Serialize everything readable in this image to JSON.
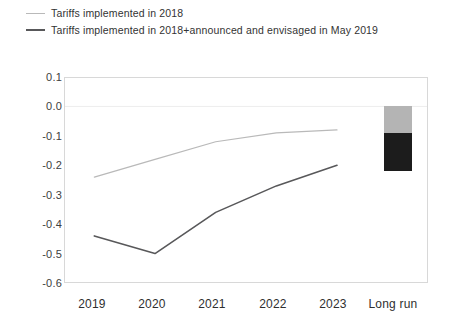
{
  "chart_data": {
    "type": "line",
    "title": "",
    "xlabel": "",
    "ylabel": "",
    "ylim": [
      -0.6,
      0.1
    ],
    "ytick_labels": [
      "0.1",
      "0.0",
      "-0.1",
      "-0.2",
      "-0.3",
      "-0.4",
      "-0.5",
      "-0.6"
    ],
    "ytick_values": [
      0.1,
      0.0,
      -0.1,
      -0.2,
      -0.3,
      -0.4,
      -0.5,
      -0.6
    ],
    "categories": [
      "2019",
      "2020",
      "2021",
      "2022",
      "2023",
      "Long run"
    ],
    "grid": false,
    "legend_position": "above-plot",
    "series": [
      {
        "name": "Tariffs implemented in 2018",
        "color": "#b9b9b9",
        "x": [
          "2019",
          "2020",
          "2021",
          "2022",
          "2023"
        ],
        "values": [
          -0.24,
          -0.18,
          -0.12,
          -0.09,
          -0.08
        ]
      },
      {
        "name": "Tariffs implemented in 2018+announced and envisaged in May 2019",
        "color": "#58585a",
        "x": [
          "2019",
          "2020",
          "2021",
          "2022",
          "2023"
        ],
        "values": [
          -0.44,
          -0.5,
          -0.36,
          -0.27,
          -0.2
        ]
      }
    ],
    "bars": [
      {
        "name": "Long run",
        "category": "Long run",
        "segments": [
          {
            "name": "Tariffs implemented in 2018",
            "color": "#b4b4b4",
            "from": 0.0,
            "to": -0.09
          },
          {
            "name": "Tariffs implemented in 2018+announced and envisaged in May 2019",
            "color": "#1c1c1c",
            "from": -0.09,
            "to": -0.22
          }
        ]
      }
    ]
  },
  "legend": {
    "items": [
      {
        "label": "Tariffs implemented in 2018"
      },
      {
        "label": "Tariffs implemented in 2018+announced and envisaged in May 2019"
      }
    ]
  },
  "axes": {
    "y_labels": [
      "0.1",
      "0.0",
      "-0.1",
      "-0.2",
      "-0.3",
      "-0.4",
      "-0.5",
      "-0.6"
    ],
    "x_labels": [
      "2019",
      "2020",
      "2021",
      "2022",
      "2023",
      "Long run"
    ]
  }
}
